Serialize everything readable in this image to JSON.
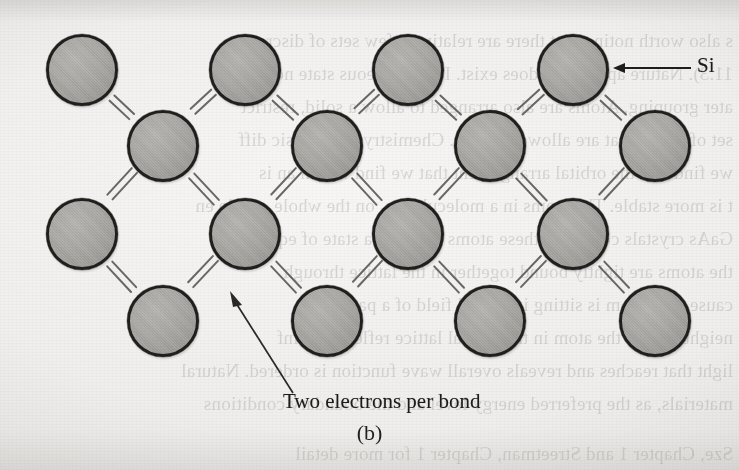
{
  "figure": {
    "panel_caption": "(b)",
    "background_color": "#f2f1ef",
    "atom_fill_color": "#aaa8a4",
    "atom_border_color": "#201f1d",
    "bond_color": "#5d5b57",
    "annotation_color": "#1d1c1a"
  },
  "annotations": {
    "si_label": "Si",
    "si_arrow_icon": "arrow-left-icon",
    "bond_label": "Two electrons per bond",
    "bond_leader_icon": "leader-arrow-icon"
  },
  "chart_data": {
    "type": "diagram",
    "subtitle": "(b)",
    "element_symbol": "Si",
    "bond_electron_count": 2,
    "bond_style": "double-parallel-line",
    "atom_radius_px": 36,
    "lattice": {
      "rows": 4,
      "stagger": "alternating",
      "row_y": [
        70,
        146,
        234,
        321
      ],
      "row_x": [
        [
          82,
          245,
          408,
          573
        ],
        [
          163,
          327,
          490,
          655
        ],
        [
          82,
          245,
          408,
          573
        ],
        [
          163,
          327,
          490,
          655
        ]
      ]
    },
    "atoms": [
      {
        "id": "a00",
        "row": 0,
        "col": 0,
        "x": 82,
        "y": 70,
        "label": "Si"
      },
      {
        "id": "a01",
        "row": 0,
        "col": 1,
        "x": 245,
        "y": 70,
        "label": "Si"
      },
      {
        "id": "a02",
        "row": 0,
        "col": 2,
        "x": 408,
        "y": 70,
        "label": "Si"
      },
      {
        "id": "a03",
        "row": 0,
        "col": 3,
        "x": 573,
        "y": 70,
        "label": "Si"
      },
      {
        "id": "a10",
        "row": 1,
        "col": 0,
        "x": 163,
        "y": 146,
        "label": "Si"
      },
      {
        "id": "a11",
        "row": 1,
        "col": 1,
        "x": 327,
        "y": 146,
        "label": "Si"
      },
      {
        "id": "a12",
        "row": 1,
        "col": 2,
        "x": 490,
        "y": 146,
        "label": "Si"
      },
      {
        "id": "a13",
        "row": 1,
        "col": 3,
        "x": 655,
        "y": 146,
        "label": "Si"
      },
      {
        "id": "a20",
        "row": 2,
        "col": 0,
        "x": 82,
        "y": 234,
        "label": "Si"
      },
      {
        "id": "a21",
        "row": 2,
        "col": 1,
        "x": 245,
        "y": 234,
        "label": "Si"
      },
      {
        "id": "a22",
        "row": 2,
        "col": 2,
        "x": 408,
        "y": 234,
        "label": "Si"
      },
      {
        "id": "a23",
        "row": 2,
        "col": 3,
        "x": 573,
        "y": 234,
        "label": "Si"
      },
      {
        "id": "a30",
        "row": 3,
        "col": 0,
        "x": 163,
        "y": 321,
        "label": "Si"
      },
      {
        "id": "a31",
        "row": 3,
        "col": 1,
        "x": 327,
        "y": 321,
        "label": "Si"
      },
      {
        "id": "a32",
        "row": 3,
        "col": 2,
        "x": 490,
        "y": 321,
        "label": "Si"
      },
      {
        "id": "a33",
        "row": 3,
        "col": 3,
        "x": 655,
        "y": 321,
        "label": "Si"
      }
    ],
    "bonds": [
      {
        "from": "a00",
        "to": "a10",
        "electrons": 2
      },
      {
        "from": "a01",
        "to": "a10",
        "electrons": 2
      },
      {
        "from": "a01",
        "to": "a11",
        "electrons": 2
      },
      {
        "from": "a02",
        "to": "a11",
        "electrons": 2
      },
      {
        "from": "a02",
        "to": "a12",
        "electrons": 2
      },
      {
        "from": "a03",
        "to": "a12",
        "electrons": 2
      },
      {
        "from": "a03",
        "to": "a13",
        "electrons": 2
      },
      {
        "from": "a10",
        "to": "a20",
        "electrons": 2
      },
      {
        "from": "a10",
        "to": "a21",
        "electrons": 2
      },
      {
        "from": "a11",
        "to": "a21",
        "electrons": 2
      },
      {
        "from": "a11",
        "to": "a22",
        "electrons": 2
      },
      {
        "from": "a12",
        "to": "a22",
        "electrons": 2
      },
      {
        "from": "a12",
        "to": "a23",
        "electrons": 2
      },
      {
        "from": "a13",
        "to": "a23",
        "electrons": 2
      },
      {
        "from": "a20",
        "to": "a30",
        "electrons": 2
      },
      {
        "from": "a21",
        "to": "a30",
        "electrons": 2
      },
      {
        "from": "a21",
        "to": "a31",
        "electrons": 2
      },
      {
        "from": "a22",
        "to": "a31",
        "electrons": 2
      },
      {
        "from": "a22",
        "to": "a32",
        "electrons": 2
      },
      {
        "from": "a23",
        "to": "a32",
        "electrons": 2
      },
      {
        "from": "a23",
        "to": "a33",
        "electrons": 2
      }
    ],
    "callouts": [
      {
        "text": "Si",
        "points_to": "a03",
        "direction": "left"
      },
      {
        "text": "Two electrons per bond",
        "points_to": "bond a21-a30",
        "direction": "up-left"
      }
    ]
  },
  "bleed_through": {
    "note": "faint mirrored text showing through from the reverse side of the printed page",
    "lines": [
      "s also worth noting that there are relatively few sets of discrete o",
      "11.3).  Nature apparently does exist.  In the gaseous state no o",
      "ater grouping.  Atoms are also arranged to allow a solid, restrict",
      "set of atoms that are allowed to mix.  Chemistry is the basic diff",
      "we find that the orbital arrangement that we find within an is",
      "t is more stable.  The atoms in a molecule are, on the whole, stable en",
      "GaAs crystals consist of these atoms cast into a state of equ",
      "the atoms are tightly bound together in the lattice through",
      "cause each atom is sitting in a local field of a particular",
      "neighbors.  So the atom in the crystal lattice reflects the inf",
      "light that reaches and reveals overall wave function is ordered.  Natural",
      "materials, as the preferred energy level and the boundary conditions",
      "Sze, Chapter 1 and Streetman, Chapter 1 for more detail"
    ]
  }
}
